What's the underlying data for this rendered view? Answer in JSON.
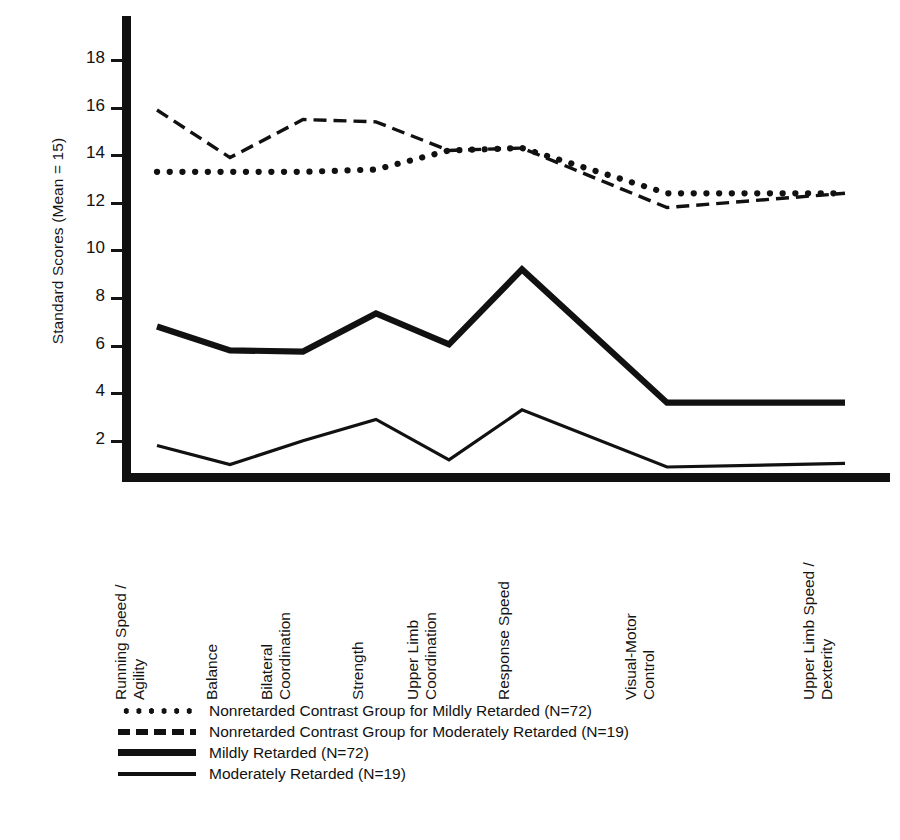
{
  "axes": {
    "y_title": "Standard Scores (Mean = 15)",
    "y_ticks": [
      "18",
      "16",
      "14",
      "12",
      "10",
      "8",
      "6",
      "4",
      "2"
    ]
  },
  "categories": [
    {
      "line1": "Running Speed /",
      "line2": "Agility"
    },
    {
      "line1": "Balance",
      "line2": ""
    },
    {
      "line1": "Bilateral",
      "line2": "Coordination"
    },
    {
      "line1": "Strength",
      "line2": ""
    },
    {
      "line1": "Upper Limb",
      "line2": "Coordination"
    },
    {
      "line1": "Response Speed",
      "line2": ""
    },
    {
      "line1": "Visual-Motor",
      "line2": "Control"
    },
    {
      "line1": "Upper Limb Speed /",
      "line2": "Dexterity"
    }
  ],
  "legend": [
    {
      "key": "dotted",
      "label": "Nonretarded Contrast Group for Mildly Retarded (N=72)"
    },
    {
      "key": "dashed",
      "label": "Nonretarded Contrast Group for Moderately Retarded (N=19)"
    },
    {
      "key": "thick",
      "label": "Mildly Retarded (N=72)"
    },
    {
      "key": "thin",
      "label": "Moderately Retarded (N=19)"
    }
  ],
  "chart_data": {
    "type": "line",
    "title": "",
    "xlabel": "",
    "ylabel": "Standard Scores (Mean = 15)",
    "ylim": [
      0,
      19.2
    ],
    "grid": false,
    "legend_position": "below-axis",
    "categories": [
      "Running Speed / Agility",
      "Balance",
      "Bilateral Coordination",
      "Strength",
      "Upper Limb Coordination",
      "Response Speed",
      "Visual-Motor Control",
      "Upper Limb Speed / Dexterity"
    ],
    "series": [
      {
        "name": "Nonretarded Contrast Group for Mildly Retarded (N=72)",
        "style": "dotted",
        "values": [
          13.3,
          13.3,
          13.3,
          13.4,
          14.2,
          14.3,
          12.4,
          12.4
        ]
      },
      {
        "name": "Nonretarded Contrast Group for Moderately Retarded (N=19)",
        "style": "dashed",
        "values": [
          15.9,
          13.9,
          15.5,
          15.4,
          14.2,
          14.3,
          11.8,
          12.4
        ]
      },
      {
        "name": "Mildly Retarded (N=72)",
        "style": "thick-solid",
        "values": [
          6.8,
          5.8,
          5.75,
          7.35,
          6.05,
          9.2,
          3.6,
          3.6
        ]
      },
      {
        "name": "Moderately Retarded (N=19)",
        "style": "thin-solid",
        "values": [
          1.8,
          1.0,
          2.0,
          2.9,
          1.2,
          3.3,
          0.9,
          1.05
        ]
      }
    ]
  },
  "geometry": {
    "x_positions": [
      157,
      230,
      303,
      376,
      449,
      522,
      667,
      845
    ],
    "y_value_18": 60,
    "px_per_unit": 23.8
  }
}
